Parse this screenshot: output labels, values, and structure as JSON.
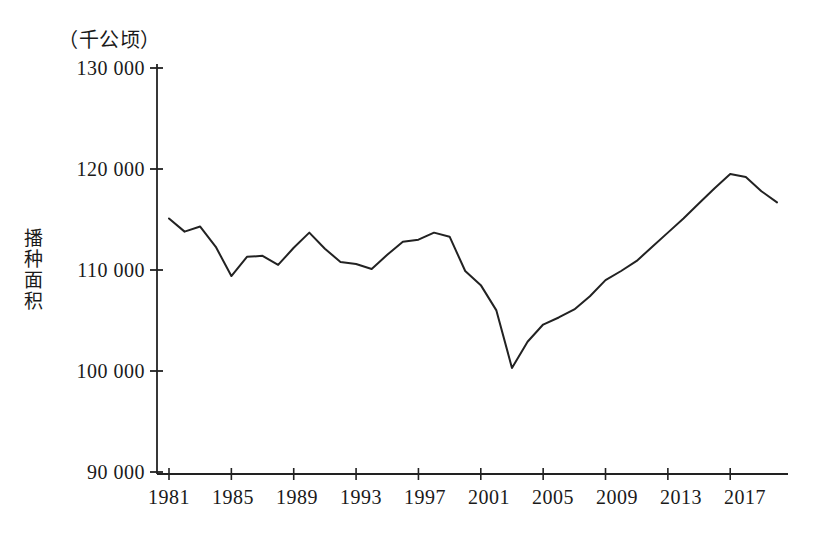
{
  "chart_data": {
    "type": "line",
    "title": "",
    "unit_label": "（千公顷）",
    "ylabel": "播种面积",
    "xlabel": "",
    "ylim": [
      90000,
      130000
    ],
    "xlim": [
      1981,
      2020
    ],
    "grid": false,
    "legend": "none",
    "y_ticks": [
      130000,
      120000,
      110000,
      100000,
      90000
    ],
    "y_tick_labels": [
      "130 000",
      "120 000",
      "110 000",
      "100 000",
      "90 000"
    ],
    "x_ticks": [
      1981,
      1985,
      1989,
      1993,
      1997,
      2001,
      2005,
      2009,
      2013,
      2017
    ],
    "x_tick_labels": [
      "1981",
      "1985",
      "1989",
      "1993",
      "1997",
      "2001",
      "2005",
      "2009",
      "2013",
      "2017"
    ],
    "line_color": "#222222",
    "series": [
      {
        "name": "播种面积",
        "x": [
          1981,
          1982,
          1983,
          1984,
          1985,
          1986,
          1987,
          1988,
          1989,
          1990,
          1991,
          1992,
          1993,
          1994,
          1995,
          1996,
          1997,
          1998,
          1999,
          2000,
          2001,
          2002,
          2003,
          2004,
          2005,
          2006,
          2007,
          2008,
          2009,
          2010,
          2011,
          2012,
          2013,
          2014,
          2015,
          2016,
          2017,
          2018,
          2019,
          2020
        ],
        "values": [
          115100,
          113800,
          114300,
          112300,
          109400,
          111300,
          111400,
          110500,
          112200,
          113700,
          112100,
          110800,
          110600,
          110100,
          111500,
          112800,
          113000,
          113700,
          113300,
          109900,
          108500,
          106000,
          100300,
          102900,
          104600,
          105300,
          106100,
          107400,
          109000,
          109900,
          110900,
          112300,
          113700,
          115100,
          116600,
          118100,
          119500,
          119200,
          117800,
          116700
        ]
      }
    ]
  }
}
